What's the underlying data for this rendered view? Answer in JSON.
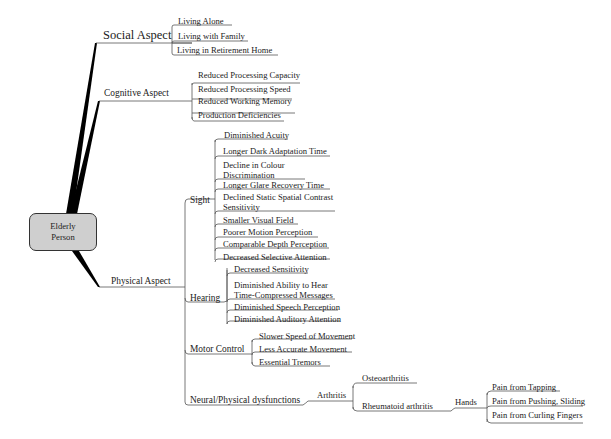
{
  "mindmap": {
    "root": {
      "label": "Elderly\nPerson",
      "line1": "Elderly",
      "line2": "Person",
      "fill": "#cfcfcf"
    },
    "social": {
      "label": "Social Aspect",
      "children": [
        "Living Alone",
        "Living with Family",
        "Living in Retirement Home"
      ]
    },
    "cognitive": {
      "label": "Cognitive Aspect",
      "children": [
        "Reduced Processing Capacity",
        "Reduced Processing Speed",
        "Reduced Working Memory",
        "Production Deficiencies"
      ]
    },
    "physical": {
      "label": "Physical Aspect",
      "sight": {
        "label": "Sight",
        "children": [
          "Diminished Acuity",
          "Longer Dark Adaptation Time",
          "Decline in Colour Discrimination",
          "Longer Glare Recovery Time",
          "Declined Static Spatial Contrast Sensitivity",
          "Smaller Visual Field",
          "Poorer Motion Perception",
          "Comparable Depth Perception",
          "Decreased Selective Attention"
        ],
        "wrapped": {
          "colour_l1": "Decline in Colour",
          "colour_l2": "Discrimination",
          "contrast_l1": "Declined Static Spatial Contrast",
          "contrast_l2": "Sensitivity"
        }
      },
      "hearing": {
        "label": "Hearing",
        "children": [
          "Decreased Sensitivity",
          "Diminished Ability to Hear Time-Compressed Messages",
          "Diminished Speech Perception",
          "Diminished Auditory Attention"
        ],
        "wrapped": {
          "ability_l1": "Diminished Ability to Hear",
          "ability_l2": "Time-Compressed Messages"
        }
      },
      "motor": {
        "label": "Motor Control",
        "children": [
          "Slower Speed of Movement",
          "Less Accurate Movement",
          "Essential Tremors"
        ]
      },
      "neural": {
        "label": "Neural/Physical dysfunctions",
        "arthritis": {
          "label": "Arthritis",
          "osteo": "Osteoarthritis",
          "rheumatoid": {
            "label": "Rheumatoid arthritis",
            "hands": {
              "label": "Hands",
              "children": [
                "Pain from Tapping",
                "Pain from Pushing, Sliding",
                "Pain from Curling Fingers"
              ]
            }
          }
        }
      }
    }
  }
}
